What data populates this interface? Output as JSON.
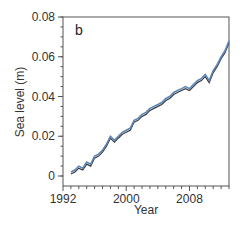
{
  "chart_data": {
    "type": "line",
    "panel_label": "b",
    "title": "",
    "xlabel": "Year",
    "ylabel": "Sea level (m)",
    "xlim": [
      1992,
      2013
    ],
    "ylim": [
      -0.005,
      0.08
    ],
    "x_ticks": [
      "1992",
      "2000",
      "2008"
    ],
    "y_ticks": [
      "0",
      "0.02",
      "0.04",
      "0.06",
      "0.08"
    ],
    "grid": false,
    "legend": null,
    "series": [
      {
        "name": "sea level (dark)",
        "color": "#3a3a3a",
        "x": [
          1993.0,
          1993.5,
          1994.0,
          1994.5,
          1995.0,
          1995.5,
          1996.0,
          1996.5,
          1997.0,
          1997.5,
          1998.0,
          1998.5,
          1999.0,
          1999.5,
          2000.0,
          2000.5,
          2001.0,
          2001.5,
          2002.0,
          2002.5,
          2003.0,
          2003.5,
          2004.0,
          2004.5,
          2005.0,
          2005.5,
          2006.0,
          2006.5,
          2007.0,
          2007.5,
          2008.0,
          2008.5,
          2009.0,
          2009.5,
          2010.0,
          2010.5,
          2011.0,
          2011.5,
          2012.0,
          2012.5,
          2013.0
        ],
        "y": [
          0.001,
          0.002,
          0.004,
          0.003,
          0.006,
          0.005,
          0.009,
          0.01,
          0.012,
          0.015,
          0.019,
          0.017,
          0.019,
          0.021,
          0.022,
          0.023,
          0.027,
          0.028,
          0.03,
          0.031,
          0.033,
          0.034,
          0.035,
          0.036,
          0.038,
          0.039,
          0.041,
          0.042,
          0.043,
          0.044,
          0.043,
          0.045,
          0.047,
          0.048,
          0.05,
          0.047,
          0.052,
          0.055,
          0.059,
          0.062,
          0.067
        ]
      },
      {
        "name": "sea level (blue)",
        "color": "#5b86b8",
        "x": [
          1993.0,
          1993.5,
          1994.0,
          1994.5,
          1995.0,
          1995.5,
          1996.0,
          1996.5,
          1997.0,
          1997.5,
          1998.0,
          1998.5,
          1999.0,
          1999.5,
          2000.0,
          2000.5,
          2001.0,
          2001.5,
          2002.0,
          2002.5,
          2003.0,
          2003.5,
          2004.0,
          2004.5,
          2005.0,
          2005.5,
          2006.0,
          2006.5,
          2007.0,
          2007.5,
          2008.0,
          2008.5,
          2009.0,
          2009.5,
          2010.0,
          2010.5,
          2011.0,
          2011.5,
          2012.0,
          2012.5,
          2013.0
        ],
        "y": [
          0.002,
          0.003,
          0.005,
          0.004,
          0.007,
          0.006,
          0.01,
          0.011,
          0.013,
          0.016,
          0.02,
          0.018,
          0.02,
          0.022,
          0.023,
          0.024,
          0.028,
          0.029,
          0.031,
          0.032,
          0.034,
          0.035,
          0.036,
          0.037,
          0.039,
          0.04,
          0.042,
          0.043,
          0.044,
          0.045,
          0.044,
          0.046,
          0.048,
          0.049,
          0.051,
          0.048,
          0.053,
          0.056,
          0.06,
          0.063,
          0.068
        ]
      }
    ]
  }
}
